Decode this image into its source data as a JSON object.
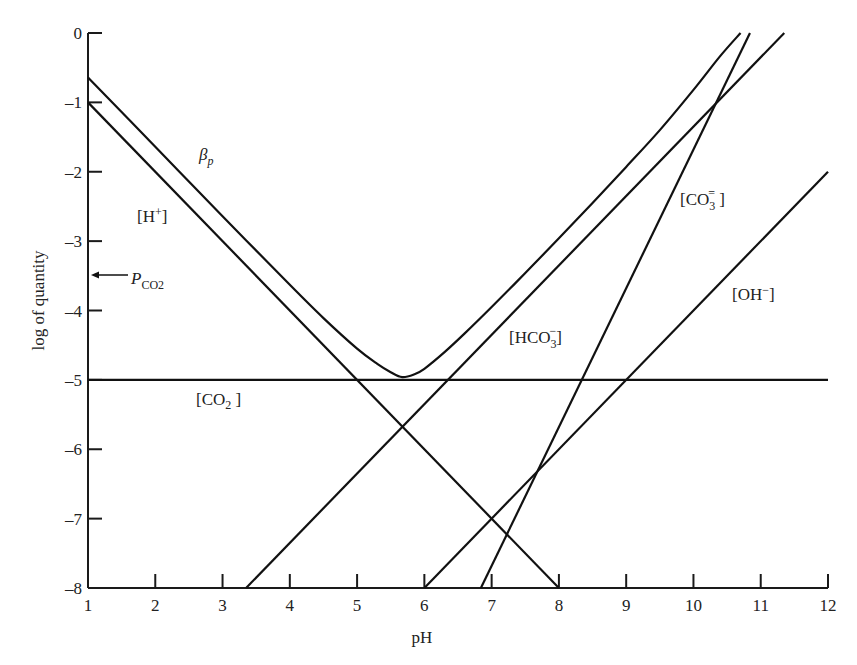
{
  "chart_data": {
    "type": "line",
    "title": "",
    "xlabel": "pH",
    "ylabel": "log of quantity",
    "xlim": [
      1,
      12
    ],
    "ylim": [
      -8,
      0
    ],
    "grid": false,
    "legend": "none (inline labels)",
    "x_ticks": [
      "1",
      "2",
      "3",
      "4",
      "5",
      "6",
      "7",
      "8",
      "9",
      "10",
      "11",
      "12"
    ],
    "y_ticks": [
      "0",
      "-1",
      "-2",
      "-3",
      "-4",
      "-5",
      "-6",
      "-7",
      "-8"
    ],
    "series": [
      {
        "name": "[H+]",
        "label_main": "[H",
        "label_sup": "+",
        "label_tail": "]",
        "x": [
          1,
          8
        ],
        "y": [
          -1,
          -8
        ]
      },
      {
        "name": "[CO2]",
        "label_main": "[CO",
        "label_sub": "2",
        "label_tail": " ]",
        "x": [
          1,
          12
        ],
        "y": [
          -5,
          -5
        ]
      },
      {
        "name": "[HCO3-]",
        "label_main": "[HCO",
        "label_sub": "3",
        "label_sup": "−",
        "label_tail": "]",
        "x": [
          3.35,
          11.35
        ],
        "y": [
          -8,
          0
        ]
      },
      {
        "name": "[CO3=]",
        "label_main": "[CO",
        "label_sub": "3",
        "label_sup": "=",
        "label_tail": " ]",
        "x": [
          6.84,
          10.84
        ],
        "y": [
          -8,
          0
        ]
      },
      {
        "name": "[OH-]",
        "label_main": "[OH",
        "label_sup": "−",
        "label_tail": "]",
        "x": [
          6,
          12
        ],
        "y": [
          -8,
          -2
        ]
      },
      {
        "name": "βp",
        "label_main": "β",
        "label_sub": "p",
        "x": [
          1,
          2,
          3,
          4,
          4.5,
          5,
          5.3,
          5.5,
          5.67,
          5.85,
          6,
          6.3,
          6.6,
          7,
          7.5,
          8,
          8.5,
          9,
          9.5,
          10,
          10.4,
          10.7
        ],
        "y": [
          -0.64,
          -1.64,
          -2.64,
          -3.63,
          -4.11,
          -4.55,
          -4.77,
          -4.89,
          -4.96,
          -4.92,
          -4.84,
          -4.6,
          -4.33,
          -3.95,
          -3.46,
          -2.96,
          -2.45,
          -1.93,
          -1.4,
          -0.82,
          -0.33,
          0
        ]
      }
    ],
    "annotations": [
      {
        "text": "P_CO2",
        "label_main": "P",
        "label_sub": "CO2",
        "arrow_to": [
          1,
          -3.5
        ]
      }
    ]
  }
}
